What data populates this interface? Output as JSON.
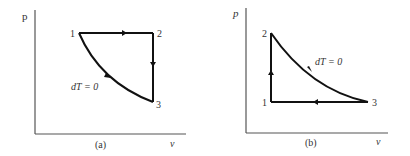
{
  "figure": {
    "panels": [
      {
        "id": "a",
        "caption": "(a)",
        "y_axis_label": "p",
        "x_axis_label": "v",
        "process_label": "dT = 0",
        "points": [
          {
            "label": "1"
          },
          {
            "label": "2"
          },
          {
            "label": "3"
          }
        ],
        "paths": [
          {
            "from": "1",
            "to": "2",
            "type": "isobaric"
          },
          {
            "from": "2",
            "to": "3",
            "type": "isochoric"
          },
          {
            "from": "3",
            "to": "1",
            "type": "isothermal"
          }
        ]
      },
      {
        "id": "b",
        "caption": "(b)",
        "y_axis_label": "p",
        "x_axis_label": "v",
        "process_label": "dT = 0",
        "points": [
          {
            "label": "1"
          },
          {
            "label": "2"
          },
          {
            "label": "3"
          }
        ],
        "paths": [
          {
            "from": "1",
            "to": "2",
            "type": "isochoric"
          },
          {
            "from": "2",
            "to": "3",
            "type": "isothermal"
          },
          {
            "from": "3",
            "to": "1",
            "type": "isobaric"
          }
        ]
      }
    ]
  }
}
